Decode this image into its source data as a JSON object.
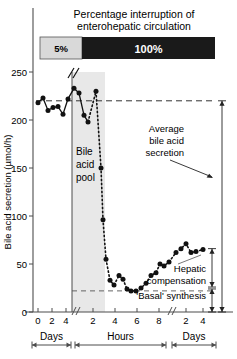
{
  "chart_data": {
    "type": "line",
    "xlabel": "",
    "ylabel": "Bile acid secretion (µmol/h)",
    "ylim": [
      0,
      250
    ],
    "yticks": [
      0,
      50,
      100,
      150,
      200,
      250
    ],
    "ytick_labels": [
      "0",
      "50",
      "100",
      "150",
      "200",
      "250"
    ],
    "grid": false,
    "legend": "none",
    "x_segments": [
      {
        "name": "Days",
        "ticks": [
          0,
          2,
          4
        ],
        "tick_labels": [
          "0",
          "2",
          "4"
        ]
      },
      {
        "name": "Hours",
        "ticks": [
          2,
          4,
          6,
          8
        ],
        "tick_labels": [
          "2",
          "4",
          "6",
          "8"
        ]
      },
      {
        "name": "Days",
        "ticks": [
          2,
          4
        ],
        "tick_labels": [
          "2",
          "4"
        ]
      }
    ],
    "axis_breaks": 2,
    "series": [
      {
        "name": "Bile acid secretion",
        "style": "dotted-line-with-filled-circles",
        "points": [
          {
            "px": 38,
            "value": 218
          },
          {
            "px": 43,
            "value": 223
          },
          {
            "px": 48,
            "value": 210
          },
          {
            "px": 53,
            "value": 213
          },
          {
            "px": 58,
            "value": 214
          },
          {
            "px": 63,
            "value": 206
          },
          {
            "px": 68,
            "value": 222
          },
          {
            "px": 74,
            "value": 233
          },
          {
            "px": 79,
            "value": 228
          },
          {
            "px": 84,
            "value": 205
          },
          {
            "px": 88,
            "value": 198
          },
          {
            "px": 96,
            "value": 230
          },
          {
            "px": 101,
            "value": 150
          },
          {
            "px": 103,
            "value": 96
          },
          {
            "px": 106,
            "value": 55
          },
          {
            "px": 110,
            "value": 33
          },
          {
            "px": 114,
            "value": 28
          },
          {
            "px": 119,
            "value": 38
          },
          {
            "px": 123,
            "value": 34
          },
          {
            "px": 127,
            "value": 24
          },
          {
            "px": 131,
            "value": 22
          },
          {
            "px": 136,
            "value": 22
          },
          {
            "px": 141,
            "value": 25
          },
          {
            "px": 146,
            "value": 30
          },
          {
            "px": 151,
            "value": 38
          },
          {
            "px": 156,
            "value": 41
          },
          {
            "px": 160,
            "value": 50
          },
          {
            "px": 164,
            "value": 48
          },
          {
            "px": 169,
            "value": 52
          },
          {
            "px": 176,
            "value": 62
          },
          {
            "px": 181,
            "value": 66
          },
          {
            "px": 186,
            "value": 71
          },
          {
            "px": 191,
            "value": 62
          },
          {
            "px": 196,
            "value": 63
          },
          {
            "px": 203,
            "value": 65
          }
        ]
      }
    ],
    "reference_line": {
      "value": 220,
      "style": "dashed",
      "label": "Average bile acid secretion"
    },
    "annotations": [
      {
        "label": "Bile acid pool",
        "kind": "shaded-region"
      },
      {
        "label": "Average bile acid secretion",
        "kind": "arrow-label"
      },
      {
        "label": "Hepatic compensation",
        "kind": "arrow-label"
      },
      {
        "label": "'Basal' synthesis",
        "kind": "arrow-label"
      }
    ]
  },
  "header": {
    "title_line1": "Percentage interruption of",
    "title_line2": "enterohepatic circulation",
    "bar_segments": [
      {
        "label": "5%",
        "color": "#d9d9d9",
        "text_color": "#000000"
      },
      {
        "label": "100%",
        "color": "#1a1a1a",
        "text_color": "#ffffff"
      }
    ]
  },
  "axes": {
    "y_label": "Bile acid secretion (µmol/h)",
    "y_ticks": [
      "250",
      "200",
      "150",
      "100",
      "50",
      "0"
    ],
    "x_ticks_days1": [
      "0",
      "2",
      "4"
    ],
    "x_ticks_hours": [
      "2",
      "4",
      "6",
      "8"
    ],
    "x_ticks_days2": [
      "2",
      "4"
    ],
    "bracket_labels": [
      "Days",
      "Hours",
      "Days"
    ]
  },
  "labels": {
    "pool_l1": "Bile",
    "pool_l2": "acid",
    "pool_l3": "pool",
    "avg_l1": "Average",
    "avg_l2": "bile acid",
    "avg_l3": "secretion",
    "hepatic_l1": "Hepatic",
    "hepatic_l2": "compensation",
    "basal": "'Basal' synthesis"
  },
  "colors": {
    "axis": "#4d4d4d",
    "data": "#111111",
    "shade": "#e8e8e8",
    "bar_light": "#d9d9d9",
    "bar_dark": "#1a1a1a"
  }
}
